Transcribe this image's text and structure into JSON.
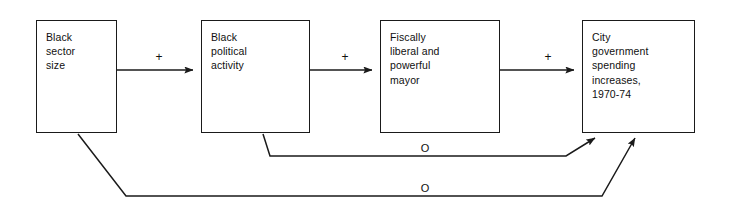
{
  "diagram": {
    "canvas": {
      "width": 733,
      "height": 210,
      "background": "#ffffff"
    },
    "line_color": "#1a1a1a",
    "text_color": "#101010",
    "nodes": [
      {
        "id": "black-sector-size",
        "label": "Black\nsector\nsize",
        "x": 36,
        "y": 20,
        "w": 81,
        "h": 113
      },
      {
        "id": "black-political-activity",
        "label": "Black\npolitical\nactivity",
        "x": 201,
        "y": 20,
        "w": 109,
        "h": 113
      },
      {
        "id": "fiscally-liberal-mayor",
        "label": "Fiscally\nliberal and\npowerful\nmayor",
        "x": 380,
        "y": 20,
        "w": 120,
        "h": 113
      },
      {
        "id": "city-government-spending",
        "label": "City\ngovernment\nspending\nincreases,\n1970-74",
        "x": 582,
        "y": 20,
        "w": 113,
        "h": 113
      }
    ],
    "edges": [
      {
        "id": "edge-sector-to-activity",
        "from": "black-sector-size",
        "to": "black-political-activity",
        "sign": "+",
        "sign_x": 151,
        "sign_y": 51,
        "path": "M117,70 L193,70"
      },
      {
        "id": "edge-activity-to-mayor",
        "from": "black-political-activity",
        "to": "fiscally-liberal-mayor",
        "sign": "+",
        "sign_x": 337,
        "sign_y": 51,
        "path": "M310,70 L372,70"
      },
      {
        "id": "edge-mayor-to-spending",
        "from": "fiscally-liberal-mayor",
        "to": "city-government-spending",
        "sign": "+",
        "sign_x": 540,
        "sign_y": 51,
        "path": "M500,70 L574,70"
      },
      {
        "id": "edge-activity-to-spending-feedback",
        "from": "black-political-activity",
        "to": "city-government-spending",
        "sign": "O",
        "sign_x": 417,
        "sign_y": 143,
        "path": "M263,134 L270,156 L566,156 L595,138"
      },
      {
        "id": "edge-sector-to-spending-feedback",
        "from": "black-sector-size",
        "to": "city-government-spending",
        "sign": "O",
        "sign_x": 417,
        "sign_y": 183,
        "path": "M78,134 L126,196 L602,196 L635,138"
      }
    ]
  }
}
